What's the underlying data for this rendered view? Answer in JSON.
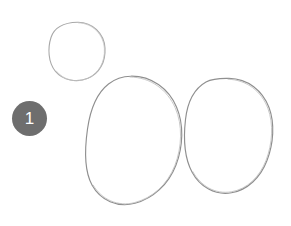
{
  "canvas": {
    "width": 291,
    "height": 226,
    "background_color": "#ffffff",
    "description": "hand-drawn-sketch-with-annotation-marker"
  },
  "sketch": {
    "stroke_color": "#9a9a9a",
    "stroke_color_light": "#b4b4b4",
    "stroke_width": 1,
    "fill": "none",
    "shapes": [
      {
        "name": "small-circle",
        "label": "small circle",
        "center_x": 77,
        "center_y": 51,
        "radius_x": 28,
        "radius_y": 29,
        "rotation": -4,
        "stroke": "#a8a8a8"
      },
      {
        "name": "left-large-oval",
        "label": "left large oval",
        "center_x": 134,
        "center_y": 141,
        "radius_x": 48,
        "radius_y": 65,
        "rotation": 3,
        "stroke": "#8f8f8f"
      },
      {
        "name": "right-large-oval",
        "label": "right large oval",
        "center_x": 228,
        "center_y": 136,
        "radius_x": 44,
        "radius_y": 58,
        "rotation": -2,
        "stroke": "#8f8f8f"
      }
    ]
  },
  "markers": [
    {
      "name": "annotation-marker-1",
      "label": "1",
      "x": 12,
      "y": 101,
      "size": 35,
      "fill_color": "#6e6e6e",
      "text_color": "#ffffff",
      "font_size": 17
    }
  ]
}
